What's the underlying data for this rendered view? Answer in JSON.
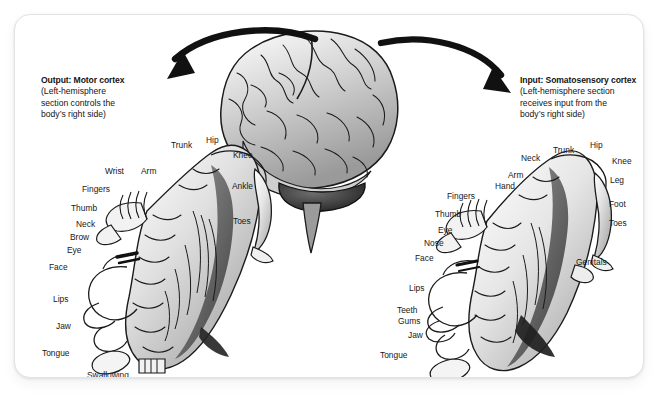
{
  "page": {
    "background_color": "#ffffff",
    "cropped_top_text": "",
    "card": {
      "background_color": "#ffffff",
      "border_color": "#e3e3e3"
    }
  },
  "figure": {
    "type": "cortical-homunculus-diagram",
    "title_left": "Output: Motor cortex",
    "title_right": "Input: Somatosensory cortex"
  },
  "callouts": {
    "left": {
      "title": "Output: Motor cortex",
      "line1": "(Left-hemisphere",
      "line2": "section controls the",
      "line3": "body’s right side)"
    },
    "right": {
      "title": "Input: Somatosensory cortex",
      "line1": "(Left-hemisphere section",
      "line2": "receives input from the",
      "line3": "body’s right side)"
    }
  },
  "arrows": {
    "left_arrow_name": "curved-arrow-to-motor-callout",
    "right_arrow_name": "curved-arrow-to-somatosensory-callout",
    "color": "#111111"
  },
  "brain": {
    "name": "lateral-view-brain-illustration",
    "ink_color": "#1b1b1b",
    "tone_color": "#b8b8b8"
  },
  "homunculus_left": {
    "name": "motor-homunculus",
    "labels": [
      {
        "text": "Trunk",
        "x": 170,
        "y": 140,
        "align": "left"
      },
      {
        "text": "Hip",
        "x": 205,
        "y": 135,
        "align": "left"
      },
      {
        "text": "Knee",
        "x": 232,
        "y": 150,
        "align": "left"
      },
      {
        "text": "Wrist",
        "x": 104,
        "y": 166,
        "align": "left"
      },
      {
        "text": "Arm",
        "x": 140,
        "y": 166,
        "align": "left"
      },
      {
        "text": "Ankle",
        "x": 231,
        "y": 181,
        "align": "left"
      },
      {
        "text": "Fingers",
        "x": 81,
        "y": 184,
        "align": "left"
      },
      {
        "text": "Thumb",
        "x": 70,
        "y": 203,
        "align": "left"
      },
      {
        "text": "Toes",
        "x": 232,
        "y": 216,
        "align": "left"
      },
      {
        "text": "Neck",
        "x": 75,
        "y": 219,
        "align": "left"
      },
      {
        "text": "Brow",
        "x": 69,
        "y": 232,
        "align": "left"
      },
      {
        "text": "Eye",
        "x": 66,
        "y": 245,
        "align": "left"
      },
      {
        "text": "Face",
        "x": 48,
        "y": 262,
        "align": "left"
      },
      {
        "text": "Lips",
        "x": 52,
        "y": 294,
        "align": "left"
      },
      {
        "text": "Jaw",
        "x": 55,
        "y": 321,
        "align": "left"
      },
      {
        "text": "Tongue",
        "x": 41,
        "y": 348,
        "align": "left"
      },
      {
        "text": "Swallowing",
        "x": 86,
        "y": 370,
        "align": "left"
      }
    ]
  },
  "homunculus_right": {
    "name": "somatosensory-homunculus",
    "labels": [
      {
        "text": "Neck",
        "x": 520,
        "y": 153,
        "align": "left"
      },
      {
        "text": "Trunk",
        "x": 552,
        "y": 145,
        "align": "left"
      },
      {
        "text": "Hip",
        "x": 589,
        "y": 140,
        "align": "left"
      },
      {
        "text": "Knee",
        "x": 611,
        "y": 156,
        "align": "left"
      },
      {
        "text": "Arm",
        "x": 507,
        "y": 170,
        "align": "left"
      },
      {
        "text": "Leg",
        "x": 609,
        "y": 175,
        "align": "left"
      },
      {
        "text": "Hand",
        "x": 494,
        "y": 181,
        "align": "left"
      },
      {
        "text": "Fingers",
        "x": 446,
        "y": 191,
        "align": "left"
      },
      {
        "text": "Foot",
        "x": 608,
        "y": 199,
        "align": "left"
      },
      {
        "text": "Thumb",
        "x": 434,
        "y": 209,
        "align": "left"
      },
      {
        "text": "Toes",
        "x": 608,
        "y": 218,
        "align": "left"
      },
      {
        "text": "Eye",
        "x": 437,
        "y": 225,
        "align": "left"
      },
      {
        "text": "Nose",
        "x": 423,
        "y": 238,
        "align": "left"
      },
      {
        "text": "Face",
        "x": 414,
        "y": 253,
        "align": "left"
      },
      {
        "text": "Genitals",
        "x": 575,
        "y": 257,
        "align": "left"
      },
      {
        "text": "Lips",
        "x": 408,
        "y": 283,
        "align": "left"
      },
      {
        "text": "Teeth",
        "x": 396,
        "y": 305,
        "align": "left"
      },
      {
        "text": "Gums",
        "x": 397,
        "y": 316,
        "align": "left"
      },
      {
        "text": "Jaw",
        "x": 407,
        "y": 330,
        "align": "left"
      },
      {
        "text": "Tongue",
        "x": 379,
        "y": 350,
        "align": "left"
      }
    ]
  }
}
